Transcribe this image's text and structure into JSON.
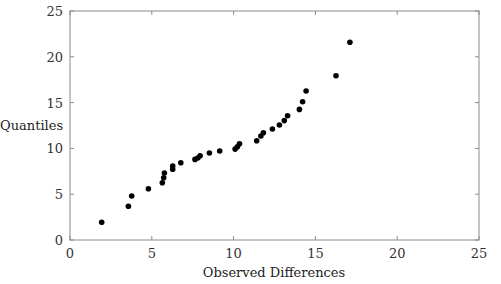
{
  "chart_data": {
    "type": "scatter",
    "title": "",
    "xlabel": "Observed Differences",
    "ylabel": "Quantiles",
    "xlim": [
      0,
      25
    ],
    "ylim": [
      0,
      25
    ],
    "xticks": [
      0,
      5,
      10,
      15,
      20,
      25
    ],
    "yticks": [
      0,
      5,
      10,
      15,
      20,
      25
    ],
    "grid": false,
    "legend": null,
    "marker_color": "#000000",
    "frame_color": "#8a8a8a",
    "series": [
      {
        "name": "Q-Q points",
        "points": [
          [
            1.94,
            1.93
          ],
          [
            3.57,
            3.68
          ],
          [
            3.77,
            4.8
          ],
          [
            4.79,
            5.6
          ],
          [
            5.64,
            6.26
          ],
          [
            5.73,
            6.8
          ],
          [
            5.77,
            7.31
          ],
          [
            6.28,
            7.72
          ],
          [
            6.28,
            8.08
          ],
          [
            6.77,
            8.44
          ],
          [
            7.64,
            8.8
          ],
          [
            7.81,
            8.95
          ],
          [
            7.95,
            9.2
          ],
          [
            8.52,
            9.5
          ],
          [
            9.15,
            9.72
          ],
          [
            10.09,
            9.92
          ],
          [
            10.23,
            10.19
          ],
          [
            10.36,
            10.5
          ],
          [
            11.41,
            10.84
          ],
          [
            11.67,
            11.35
          ],
          [
            11.82,
            11.71
          ],
          [
            12.37,
            12.12
          ],
          [
            12.8,
            12.55
          ],
          [
            13.1,
            13.03
          ],
          [
            13.3,
            13.57
          ],
          [
            14.02,
            14.26
          ],
          [
            14.22,
            15.1
          ],
          [
            14.43,
            16.27
          ],
          [
            16.26,
            17.94
          ],
          [
            17.11,
            21.58
          ]
        ]
      }
    ]
  }
}
